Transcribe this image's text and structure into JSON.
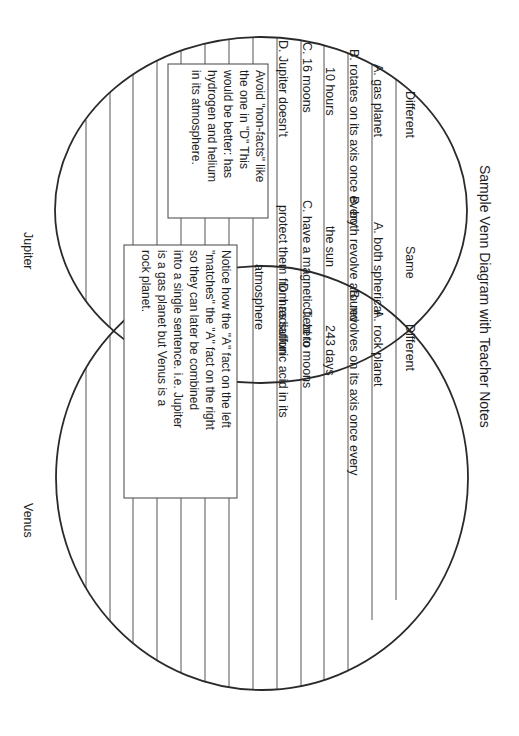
{
  "title": "Sample Venn Diagram with Teacher Notes",
  "circle_labels": {
    "left": "Jupiter",
    "right": "Venus"
  },
  "section_headers": {
    "left": "Different",
    "middle": "Same",
    "right": "Different"
  },
  "jupiter_different": [
    "A.  gas planet",
    "B. rotates on its axis once every",
    "10 hours",
    "C.  16 moons",
    "D.  Jupiter doesn't"
  ],
  "same": [
    "A. both spherical",
    "B. both revolve around",
    "the sun",
    "C. have a magnetic field to",
    "protect them from radiation"
  ],
  "venus_different": [
    "A.  rock planet",
    "B. revolves on its axis once every",
    "243 days",
    "C.  zero moons",
    "D. has sulfuric acid in its",
    "atmosphere"
  ],
  "teacher_notes": {
    "note1": [
      "Avoid \"non-facts\" like",
      "the one in \"D\" This",
      "would be better:  has",
      "hydrogen and helium",
      "in its atmosphere."
    ],
    "note2": [
      "Notice how the \"A\" fact on the left",
      "\"matches\" the \"A\" fact on the right",
      "so they can later be combined",
      "into a single sentence.  i.e. Jupiter",
      "is a gas planet but Venus is a",
      "rock planet."
    ]
  },
  "colors": {
    "ink": "#1e1e1e",
    "lines": "#555555",
    "background": "#ffffff"
  }
}
